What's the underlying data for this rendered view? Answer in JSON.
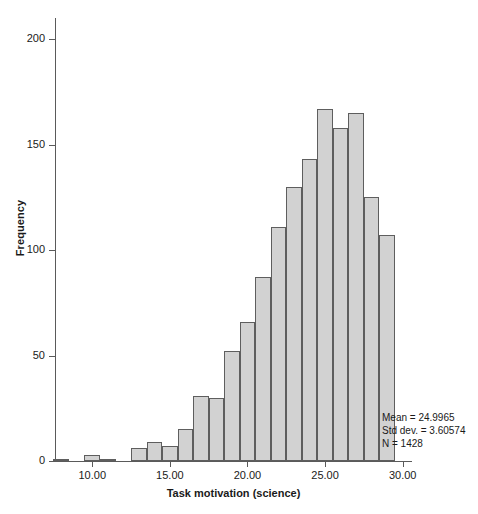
{
  "chart_data": {
    "type": "bar",
    "title": "",
    "subtitle": "",
    "xlabel": "Task motivation (science)",
    "ylabel": "Frequency",
    "xlim": [
      7.6,
      30.6
    ],
    "ylim": [
      0,
      210
    ],
    "grid": false,
    "legend": null,
    "bin_width": 1,
    "x_tick_labels": [
      "10.00",
      "15.00",
      "20.00",
      "25.00",
      "30.00"
    ],
    "x_tick_values": [
      10,
      15,
      20,
      25,
      30
    ],
    "y_tick_labels": [
      "0",
      "50",
      "100",
      "150",
      "200"
    ],
    "y_tick_values": [
      0,
      50,
      100,
      150,
      200
    ],
    "categories": [
      "8.0",
      "9.0",
      "10.0",
      "11.0",
      "12.0",
      "13.0",
      "14.0",
      "15.0",
      "16.0",
      "17.0",
      "18.0",
      "19.0",
      "20.0",
      "21.0",
      "22.0",
      "23.0",
      "24.0",
      "25.0",
      "26.0",
      "27.0",
      "28.0",
      "29.0"
    ],
    "bin_centers": [
      8.0,
      9.0,
      10.0,
      11.0,
      12.0,
      13.0,
      14.0,
      15.0,
      16.0,
      17.0,
      18.0,
      19.0,
      20.0,
      21.0,
      22.0,
      23.0,
      24.0,
      25.0,
      26.0,
      27.0,
      28.0,
      29.0
    ],
    "values": [
      1,
      0,
      3,
      1,
      0,
      6,
      9,
      7,
      15,
      31,
      30,
      52,
      66,
      87,
      111,
      130,
      143,
      167,
      158,
      165,
      125,
      107
    ],
    "annotations": {
      "mean_label": "Mean = 24.9965",
      "std_label": "Std dev. = 3.60574",
      "n_label": "N = 1428",
      "mean": 24.9965,
      "std_dev": 3.60574,
      "n": 1428
    },
    "colors": {
      "bar_fill": "#d2d2d2",
      "bar_stroke": "#5e5e5e",
      "axis": "#5a5a5a",
      "text": "#1a1a1a",
      "background": "#ffffff"
    }
  }
}
